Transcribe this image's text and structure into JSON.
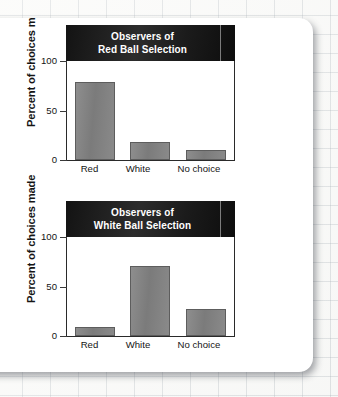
{
  "figure": {
    "background": "graph-paper",
    "card_color": "#ffffff"
  },
  "chart_data": [
    {
      "type": "bar",
      "title": "Observers of Red Ball Selection",
      "title_lines": [
        "Observers of",
        "Red Ball Selection"
      ],
      "categories": [
        "Red",
        "White",
        "No choice"
      ],
      "values": [
        87,
        20,
        11
      ],
      "xlabel": "",
      "ylabel": "Percent of choices made",
      "ylim": [
        0,
        110
      ],
      "yticks": [
        0,
        50,
        100
      ],
      "ytick_labels": [
        "0",
        "50",
        "100"
      ],
      "grid": false,
      "legend": "none",
      "bar_color": "#808080",
      "title_bar_color": "#161616",
      "title_text_color": "#ffffff"
    },
    {
      "type": "bar",
      "title": "Observers of White Ball Selection",
      "title_lines": [
        "Observers of",
        "White Ball Selection"
      ],
      "categories": [
        "Red",
        "White",
        "No choice"
      ],
      "values": [
        10,
        78,
        30
      ],
      "xlabel": "",
      "ylabel": "Percent of choices made",
      "ylim": [
        0,
        110
      ],
      "yticks": [
        0,
        50,
        100
      ],
      "ytick_labels": [
        "0",
        "50",
        "100"
      ],
      "grid": false,
      "legend": "none",
      "bar_color": "#808080",
      "title_bar_color": "#161616",
      "title_text_color": "#ffffff"
    }
  ]
}
